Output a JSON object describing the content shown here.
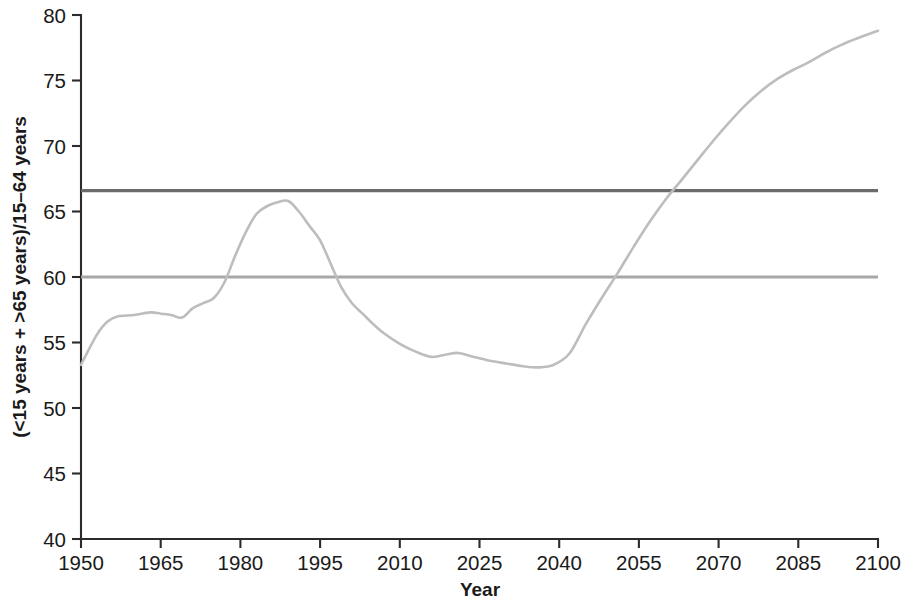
{
  "chart_data": {
    "type": "line",
    "title": "",
    "subtitle": "",
    "xlabel": "Year",
    "ylabel": "(<15 years + >65 years)/15–64 years",
    "xlim": [
      1950,
      2100
    ],
    "ylim": [
      40,
      80
    ],
    "xticks": [
      1950,
      1965,
      1980,
      1995,
      2010,
      2025,
      2040,
      2055,
      2070,
      2085,
      2100
    ],
    "yticks": [
      40,
      45,
      50,
      55,
      60,
      65,
      70,
      75,
      80
    ],
    "grid": false,
    "legend": "none",
    "series": [
      {
        "name": "Total dependency ratio",
        "color": "#bdbdbd",
        "type": "line",
        "x": [
          1950,
          1953,
          1955,
          1957,
          1960,
          1963,
          1965,
          1967,
          1969,
          1971,
          1973,
          1975,
          1977,
          1979,
          1981,
          1983,
          1985,
          1987,
          1989,
          1991,
          1993,
          1995,
          1997,
          1999,
          2001,
          2003,
          2005,
          2007,
          2010,
          2013,
          2016,
          2019,
          2021,
          2024,
          2027,
          2030,
          2033,
          2036,
          2039,
          2042,
          2045,
          2048,
          2051,
          2054,
          2057,
          2060,
          2063,
          2066,
          2069,
          2072,
          2075,
          2078,
          2081,
          2084,
          2087,
          2090,
          2093,
          2096,
          2100
        ],
        "y": [
          53.3,
          55.6,
          56.6,
          57.0,
          57.1,
          57.3,
          57.2,
          57.1,
          56.9,
          57.6,
          58.0,
          58.4,
          59.6,
          61.6,
          63.4,
          64.8,
          65.4,
          65.7,
          65.8,
          65.0,
          63.9,
          62.8,
          61.0,
          59.2,
          58.0,
          57.2,
          56.4,
          55.7,
          54.9,
          54.3,
          53.9,
          54.1,
          54.2,
          53.9,
          53.6,
          53.4,
          53.2,
          53.1,
          53.3,
          54.2,
          56.4,
          58.4,
          60.3,
          62.3,
          64.2,
          65.9,
          67.4,
          68.9,
          70.4,
          71.8,
          73.1,
          74.2,
          75.1,
          75.8,
          76.4,
          77.1,
          77.7,
          78.2,
          78.8
        ]
      },
      {
        "name": "Upper reference level",
        "color": "#6b6b6b",
        "type": "hline",
        "value": 66.6
      },
      {
        "name": "Lower reference level",
        "color": "#a8a8a8",
        "type": "hline",
        "value": 60.0
      }
    ]
  }
}
